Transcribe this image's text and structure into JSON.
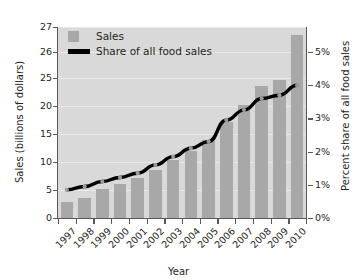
{
  "chart_data": {
    "type": "bar",
    "title": "",
    "xlabel": "Year",
    "ylabel": "Sales (billions of dollars)",
    "y2label": "Percent share of all food sales",
    "categories": [
      "1997",
      "1998",
      "1999",
      "2000",
      "2001",
      "2002",
      "2003",
      "2004",
      "2005",
      "2006",
      "2007",
      "2008",
      "2009",
      "2010"
    ],
    "series": [
      {
        "name": "Sales",
        "type": "bar",
        "axis": "left",
        "unit": "billions of dollars",
        "color": "#a8a8a8",
        "values": [
          2.9,
          3.6,
          5.1,
          6.0,
          7.2,
          8.6,
          10.3,
          12.0,
          14.0,
          17.1,
          20.2,
          23.5,
          24.7,
          26.7
        ]
      },
      {
        "name": "Share of all food sales",
        "type": "line",
        "axis": "right",
        "unit": "percent",
        "color": "#000000",
        "values": [
          0.85,
          0.95,
          1.1,
          1.22,
          1.35,
          1.6,
          1.85,
          2.1,
          2.3,
          2.95,
          3.25,
          3.6,
          3.7,
          4.0
        ]
      }
    ],
    "left_axis": {
      "ticks": [
        "0",
        "5",
        "10",
        "15",
        "20",
        "25",
        "26",
        "27"
      ],
      "tick_values": [
        0,
        5,
        10,
        15,
        20,
        25,
        26,
        27
      ],
      "broken_scale": true,
      "ylim": [
        0,
        27
      ]
    },
    "right_axis": {
      "ticks": [
        "0%",
        "1%",
        "2%",
        "3%",
        "4%",
        "5%"
      ],
      "tick_values": [
        0,
        1,
        2,
        3,
        4,
        5
      ],
      "ylim": [
        0,
        5.5
      ]
    },
    "legend": {
      "position": "top-left-inside",
      "entries": [
        {
          "label": "Sales",
          "marker": "square",
          "color": "#a8a8a8"
        },
        {
          "label": "Share of all food sales",
          "marker": "line",
          "color": "#000000"
        }
      ]
    },
    "grid": true,
    "plot_background": "#d9d9d9"
  },
  "labels": {
    "y_axis_title": "Sales (billions of dollars)",
    "y2_axis_title": "Percent share of all food sales",
    "x_axis_title": "Year"
  }
}
